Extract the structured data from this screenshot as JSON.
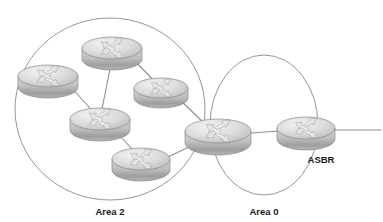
{
  "diagram": {
    "background_color": "#ffffff",
    "stroke_color": "#8a8a8a",
    "link_color": "#8f8f8f",
    "label_color": "#1a1a1a",
    "router_body_color": "#c9c9c9",
    "router_top_color": "#e2e2e2",
    "router_shadow_color": "#9a9a9a",
    "areas": [
      {
        "id": "area-2",
        "label": "Area 2",
        "label_x": 110,
        "label_y": 215,
        "shape": "ellipse",
        "cx": 110,
        "cy": 109,
        "rx": 95,
        "ry": 91
      },
      {
        "id": "area-0",
        "label": "Area 0",
        "label_x": 264,
        "label_y": 215,
        "shape": "ellipse",
        "cx": 264,
        "cy": 125,
        "rx": 54,
        "ry": 70
      }
    ],
    "routers": [
      {
        "id": "r1",
        "name": "area2-router-top",
        "x": 112,
        "y": 48,
        "rx": 30,
        "ry": 11,
        "h": 11,
        "label": ""
      },
      {
        "id": "r2",
        "name": "area2-router-left",
        "x": 48,
        "y": 76,
        "rx": 30,
        "ry": 11,
        "h": 11,
        "label": ""
      },
      {
        "id": "r3",
        "name": "area2-router-right",
        "x": 161,
        "y": 88,
        "rx": 27,
        "ry": 10,
        "h": 10,
        "label": ""
      },
      {
        "id": "r4",
        "name": "area2-router-center",
        "x": 100,
        "y": 119,
        "rx": 30,
        "ry": 11,
        "h": 11,
        "label": ""
      },
      {
        "id": "r5",
        "name": "area2-router-bottom",
        "x": 141,
        "y": 159,
        "rx": 29,
        "ry": 11,
        "h": 11,
        "label": ""
      },
      {
        "id": "r6",
        "name": "abr-router",
        "x": 218,
        "y": 131,
        "rx": 33,
        "ry": 12,
        "h": 12,
        "label": ""
      },
      {
        "id": "r7",
        "name": "asbr-router",
        "x": 306,
        "y": 128,
        "rx": 29,
        "ry": 11,
        "h": 11,
        "label": "ASBR"
      }
    ],
    "router_labels": [
      {
        "id": "asbr-label",
        "text": "ASBR",
        "x": 321,
        "y": 163
      }
    ],
    "links": [
      {
        "id": "l1",
        "name": "link-top-to-center",
        "x1": 112,
        "y1": 59,
        "x2": 100,
        "y2": 119
      },
      {
        "id": "l2",
        "name": "link-top-to-right",
        "x1": 130,
        "y1": 56,
        "x2": 161,
        "y2": 88
      },
      {
        "id": "l3",
        "name": "link-left-to-center",
        "x1": 68,
        "y1": 84,
        "x2": 100,
        "y2": 119
      },
      {
        "id": "l4",
        "name": "link-center-to-bottom",
        "x1": 113,
        "y1": 128,
        "x2": 141,
        "y2": 159
      },
      {
        "id": "l5",
        "name": "link-bottom-to-abr",
        "x1": 168,
        "y1": 157,
        "x2": 208,
        "y2": 138
      },
      {
        "id": "l6",
        "name": "link-right-to-abr",
        "x1": 176,
        "y1": 96,
        "x2": 205,
        "y2": 124
      },
      {
        "id": "l7",
        "name": "link-abr-to-asbr",
        "x1": 251,
        "y1": 133,
        "x2": 279,
        "y2": 131
      },
      {
        "id": "l8",
        "name": "link-asbr-to-external",
        "x1": 334,
        "y1": 130,
        "x2": 381,
        "y2": 130
      }
    ]
  }
}
